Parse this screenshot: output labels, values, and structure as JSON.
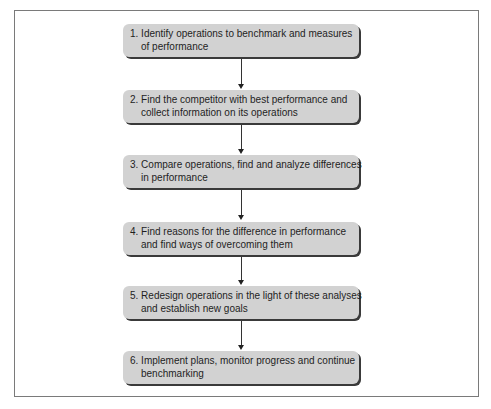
{
  "diagram": {
    "type": "flowchart",
    "direction": "top-to-bottom",
    "box_fill": "#d2d2d2",
    "box_shadow": "#3a3a3a",
    "frame_border": "#7a7a7a",
    "steps": [
      {
        "number": "1.",
        "line1": "1. Identify operations to benchmark and measures",
        "line2": "of performance"
      },
      {
        "number": "2.",
        "line1": "2. Find the competitor with best performance and",
        "line2": "collect information on its operations"
      },
      {
        "number": "3.",
        "line1": "3. Compare operations, find and analyze differences",
        "line2": "in performance"
      },
      {
        "number": "4.",
        "line1": "4. Find reasons for the difference in performance",
        "line2": "and find ways of overcoming them"
      },
      {
        "number": "5.",
        "line1": "5. Redesign operations in the light of these analyses",
        "line2": "and establish new goals"
      },
      {
        "number": "6.",
        "line1": "6. Implement plans, monitor progress and continue",
        "line2": "benchmarking"
      }
    ],
    "connections": [
      {
        "from": 1,
        "to": 2
      },
      {
        "from": 2,
        "to": 3
      },
      {
        "from": 3,
        "to": 4
      },
      {
        "from": 4,
        "to": 5
      },
      {
        "from": 5,
        "to": 6
      }
    ]
  }
}
